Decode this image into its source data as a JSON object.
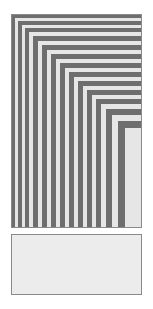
{
  "figure": {
    "canvas": {
      "width": 153,
      "height": 309,
      "background": "#ffffff"
    },
    "colors": {
      "dark_band": "#6e6e6e",
      "light_band": "#e6e6e6",
      "panel_fill": "#ececec",
      "border": "#8a8a8a",
      "background": "#ffffff"
    }
  },
  "nested_panel": {
    "name": "nested-band-panel",
    "x": 11,
    "y": 14,
    "width": 131,
    "height": 214,
    "border_color": "#8a8a8a",
    "border_width": 1,
    "description": "Concentric nested L-shaped bands opening toward the top-left corner; alternating dark gray and light gray rings of decreasing size.",
    "ring_count": 26,
    "innermost_fill": "#e6e6e6",
    "rings": [
      {
        "index": 0,
        "inset_left": 0,
        "inset_top": 0,
        "color": "#6e6e6e",
        "thickness": 3
      },
      {
        "index": 1,
        "inset_left": 3,
        "inset_top": 3,
        "color": "#e6e6e6",
        "thickness": 3
      },
      {
        "index": 2,
        "inset_left": 6,
        "inset_top": 6,
        "color": "#6e6e6e",
        "thickness": 4
      },
      {
        "index": 3,
        "inset_left": 10,
        "inset_top": 10,
        "color": "#e6e6e6",
        "thickness": 3
      },
      {
        "index": 4,
        "inset_left": 13,
        "inset_top": 13,
        "color": "#6e6e6e",
        "thickness": 4
      },
      {
        "index": 5,
        "inset_left": 17,
        "inset_top": 17,
        "color": "#e6e6e6",
        "thickness": 4
      },
      {
        "index": 6,
        "inset_left": 21,
        "inset_top": 21,
        "color": "#6e6e6e",
        "thickness": 5
      },
      {
        "index": 7,
        "inset_left": 26,
        "inset_top": 26,
        "color": "#e6e6e6",
        "thickness": 4
      },
      {
        "index": 8,
        "inset_left": 30,
        "inset_top": 30,
        "color": "#6e6e6e",
        "thickness": 5
      },
      {
        "index": 9,
        "inset_left": 35,
        "inset_top": 35,
        "color": "#e6e6e6",
        "thickness": 4
      },
      {
        "index": 10,
        "inset_left": 39,
        "inset_top": 39,
        "color": "#6e6e6e",
        "thickness": 5
      },
      {
        "index": 11,
        "inset_left": 44,
        "inset_top": 44,
        "color": "#e6e6e6",
        "thickness": 4
      },
      {
        "index": 12,
        "inset_left": 48,
        "inset_top": 48,
        "color": "#6e6e6e",
        "thickness": 5
      },
      {
        "index": 13,
        "inset_left": 53,
        "inset_top": 53,
        "color": "#e6e6e6",
        "thickness": 4
      },
      {
        "index": 14,
        "inset_left": 57,
        "inset_top": 57,
        "color": "#6e6e6e",
        "thickness": 5
      },
      {
        "index": 15,
        "inset_left": 62,
        "inset_top": 62,
        "color": "#e6e6e6",
        "thickness": 4
      },
      {
        "index": 16,
        "inset_left": 66,
        "inset_top": 66,
        "color": "#6e6e6e",
        "thickness": 5
      },
      {
        "index": 17,
        "inset_left": 71,
        "inset_top": 71,
        "color": "#e6e6e6",
        "thickness": 4
      },
      {
        "index": 18,
        "inset_left": 75,
        "inset_top": 75,
        "color": "#6e6e6e",
        "thickness": 5
      },
      {
        "index": 19,
        "inset_left": 80,
        "inset_top": 80,
        "color": "#e6e6e6",
        "thickness": 4
      },
      {
        "index": 20,
        "inset_left": 84,
        "inset_top": 84,
        "color": "#6e6e6e",
        "thickness": 5
      },
      {
        "index": 21,
        "inset_left": 89,
        "inset_top": 89,
        "color": "#e6e6e6",
        "thickness": 5
      },
      {
        "index": 22,
        "inset_left": 94,
        "inset_top": 94,
        "color": "#6e6e6e",
        "thickness": 6
      },
      {
        "index": 23,
        "inset_left": 100,
        "inset_top": 100,
        "color": "#e6e6e6",
        "thickness": 6
      },
      {
        "index": 24,
        "inset_left": 106,
        "inset_top": 106,
        "color": "#6e6e6e",
        "thickness": 7
      },
      {
        "index": 25,
        "inset_left": 113,
        "inset_top": 113,
        "color": "#e6e6e6",
        "thickness": 8
      }
    ]
  },
  "lower_panel": {
    "name": "lower-panel",
    "x": 11,
    "y": 234,
    "width": 131,
    "height": 61,
    "fill": "#ececec",
    "border_color": "#8a8a8a",
    "border_width": 1,
    "description": "Plain light gray rectangle with thin gray outline."
  }
}
